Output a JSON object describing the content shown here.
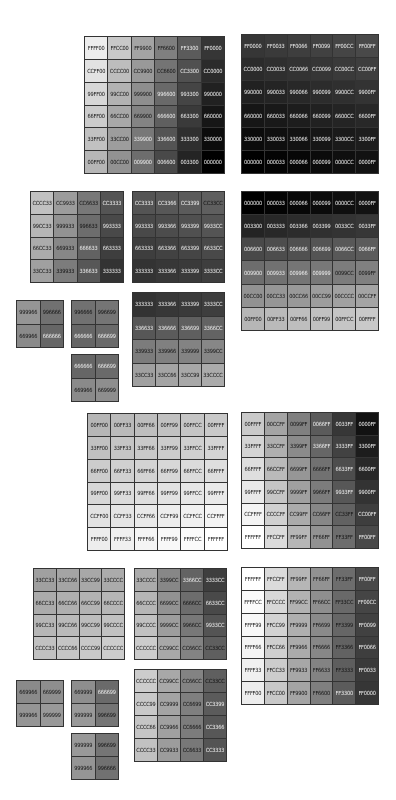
{
  "swatch_grids": [
    {
      "id": "g1",
      "x": 84,
      "y": 36,
      "w": 141,
      "h": 138,
      "cols": 6,
      "cells": [
        "FFFF00",
        "FFCC00",
        "FF9900",
        "FF6600",
        "FF3300",
        "FF0000",
        "CCFF00",
        "CCCC00",
        "CC9900",
        "CC6600",
        "CC3300",
        "CC0000",
        "99FF00",
        "99CC00",
        "999900",
        "996600",
        "993300",
        "990000",
        "66FF00",
        "66CC00",
        "669900",
        "666600",
        "663300",
        "660000",
        "33FF00",
        "33CC00",
        "339900",
        "336600",
        "333300",
        "330000",
        "00FF00",
        "00CC00",
        "009900",
        "006600",
        "003300",
        "000000"
      ]
    },
    {
      "id": "g2",
      "x": 241,
      "y": 34,
      "w": 138,
      "h": 140,
      "cols": 6,
      "cells": [
        "FF0000",
        "FF0033",
        "FF0066",
        "FF0099",
        "FF00CC",
        "FF00FF",
        "CC0000",
        "CC0033",
        "CC0066",
        "CC0099",
        "CC00CC",
        "CC00FF",
        "990000",
        "990033",
        "990066",
        "990099",
        "9900CC",
        "9900FF",
        "660000",
        "660033",
        "660066",
        "660099",
        "6600CC",
        "6600FF",
        "330000",
        "330033",
        "330066",
        "330099",
        "3300CC",
        "3300FF",
        "000000",
        "000033",
        "000066",
        "000099",
        "0000CC",
        "0000FF"
      ]
    },
    {
      "id": "g3",
      "x": 30,
      "y": 191,
      "w": 94,
      "h": 92,
      "cols": 4,
      "cells": [
        "CCCC33",
        "CC9933",
        "CC6633",
        "CC3333",
        "99CC33",
        "999933",
        "996633",
        "993333",
        "66CC33",
        "669933",
        "666633",
        "663333",
        "33CC33",
        "339933",
        "336633",
        "333333"
      ]
    },
    {
      "id": "g4",
      "x": 132,
      "y": 191,
      "w": 93,
      "h": 92,
      "cols": 4,
      "cells": [
        "CC3333",
        "CC3366",
        "CC3399",
        "CC33CC",
        "993333",
        "993366",
        "993399",
        "9933CC",
        "663333",
        "663366",
        "663399",
        "6633CC",
        "333333",
        "333366",
        "333399",
        "3333CC"
      ]
    },
    {
      "id": "g5",
      "x": 241,
      "y": 191,
      "w": 138,
      "h": 140,
      "cols": 6,
      "cells": [
        "000000",
        "000033",
        "000066",
        "000099",
        "0000CC",
        "0000FF",
        "003300",
        "003333",
        "003366",
        "003399",
        "0033CC",
        "0033FF",
        "006600",
        "006633",
        "006666",
        "006699",
        "0066CC",
        "0066FF",
        "009900",
        "009933",
        "009966",
        "009999",
        "0099CC",
        "0099FF",
        "00CC00",
        "00CC33",
        "00CC66",
        "00CC99",
        "00CCCC",
        "00CCFF",
        "00FF00",
        "00FF33",
        "00FF66",
        "00FF99",
        "00FFCC",
        "00FFFF"
      ]
    },
    {
      "id": "g6",
      "x": 16,
      "y": 300,
      "w": 48,
      "h": 48,
      "cols": 2,
      "cells": [
        "999966",
        "996666",
        "669966",
        "666666"
      ]
    },
    {
      "id": "g7",
      "x": 71,
      "y": 300,
      "w": 48,
      "h": 48,
      "cols": 2,
      "cells": [
        "996666",
        "996699",
        "666666",
        "666699"
      ]
    },
    {
      "id": "g8",
      "x": 71,
      "y": 354,
      "w": 48,
      "h": 48,
      "cols": 2,
      "cells": [
        "666666",
        "666699",
        "669966",
        "669999"
      ]
    },
    {
      "id": "g9",
      "x": 132,
      "y": 292,
      "w": 93,
      "h": 95,
      "cols": 4,
      "cells": [
        "333333",
        "333366",
        "333399",
        "3333CC",
        "336633",
        "336666",
        "336699",
        "3366CC",
        "339933",
        "339966",
        "339999",
        "3399CC",
        "33CC33",
        "33CC66",
        "33CC99",
        "33CCCC"
      ]
    },
    {
      "id": "g10",
      "x": 87,
      "y": 413,
      "w": 141,
      "h": 138,
      "cols": 6,
      "cells": [
        "00FF00",
        "00FF33",
        "00FF66",
        "00FF99",
        "00FFCC",
        "00FFFF",
        "33FF00",
        "33FF33",
        "33FF66",
        "33FF99",
        "33FFCC",
        "33FFFF",
        "66FF00",
        "66FF33",
        "66FF66",
        "66FF99",
        "66FFCC",
        "66FFFF",
        "99FF00",
        "99FF33",
        "99FF66",
        "99FF99",
        "99FFCC",
        "99FFFF",
        "CCFF00",
        "CCFF33",
        "CCFF66",
        "CCFF99",
        "CCFFCC",
        "CCFFFF",
        "FFFF00",
        "FFFF33",
        "FFFF66",
        "FFFF99",
        "FFFFCC",
        "FFFFFF"
      ]
    },
    {
      "id": "g11",
      "x": 241,
      "y": 412,
      "w": 138,
      "h": 137,
      "cols": 6,
      "cells": [
        "00FFFF",
        "00CCFF",
        "0099FF",
        "0066FF",
        "0033FF",
        "0000FF",
        "33FFFF",
        "33CCFF",
        "3399FF",
        "3366FF",
        "3333FF",
        "3300FF",
        "66FFFF",
        "66CCFF",
        "6699FF",
        "6666FF",
        "6633FF",
        "6600FF",
        "99FFFF",
        "99CCFF",
        "9999FF",
        "9966FF",
        "9933FF",
        "9900FF",
        "CCFFFF",
        "CCCCFF",
        "CC99FF",
        "CC66FF",
        "CC33FF",
        "CC00FF",
        "FFFFFF",
        "FFCCFF",
        "FF99FF",
        "FF66FF",
        "FF33FF",
        "FF00FF"
      ]
    },
    {
      "id": "g12",
      "x": 33,
      "y": 568,
      "w": 92,
      "h": 92,
      "cols": 4,
      "cells": [
        "33CC33",
        "33CC66",
        "33CC99",
        "33CCCC",
        "66CC33",
        "66CC66",
        "66CC99",
        "66CCCC",
        "99CC33",
        "99CC66",
        "99CC99",
        "99CCCC",
        "CCCC33",
        "CCCC66",
        "CCCC99",
        "CCCCCC"
      ]
    },
    {
      "id": "g13",
      "x": 134,
      "y": 568,
      "w": 93,
      "h": 92,
      "cols": 4,
      "cells": [
        "33CCCC",
        "3399CC",
        "3366CC",
        "3333CC",
        "66CCCC",
        "6699CC",
        "6666CC",
        "6633CC",
        "99CCCC",
        "9999CC",
        "9966CC",
        "9933CC",
        "CCCCCC",
        "CC99CC",
        "CC66CC",
        "CC33CC"
      ]
    },
    {
      "id": "g14",
      "x": 134,
      "y": 669,
      "w": 93,
      "h": 93,
      "cols": 4,
      "cells": [
        "CCCCCC",
        "CC99CC",
        "CC66CC",
        "CC33CC",
        "CCCC99",
        "CC9999",
        "CC6699",
        "CC3399",
        "CCCC66",
        "CC9966",
        "CC6666",
        "CC3366",
        "CCCC33",
        "CC9933",
        "CC6633",
        "CC3333"
      ]
    },
    {
      "id": "g15",
      "x": 16,
      "y": 680,
      "w": 48,
      "h": 47,
      "cols": 2,
      "cells": [
        "669966",
        "669999",
        "999966",
        "999999"
      ]
    },
    {
      "id": "g16",
      "x": 71,
      "y": 680,
      "w": 48,
      "h": 47,
      "cols": 2,
      "cells": [
        "669999",
        "666699",
        "999999",
        "996699"
      ]
    },
    {
      "id": "g17",
      "x": 71,
      "y": 733,
      "w": 48,
      "h": 47,
      "cols": 2,
      "cells": [
        "999999",
        "996699",
        "999966",
        "996666"
      ]
    },
    {
      "id": "g18",
      "x": 241,
      "y": 567,
      "w": 138,
      "h": 138,
      "cols": 6,
      "cells": [
        "FFFFFF",
        "FFCCFF",
        "FF99FF",
        "FF66FF",
        "FF33FF",
        "FF00FF",
        "FFFFCC",
        "FFCCCC",
        "FF99CC",
        "FF66CC",
        "FF33CC",
        "FF00CC",
        "FFFF99",
        "FFCC99",
        "FF9999",
        "FF6699",
        "FF3399",
        "FF0099",
        "FFFF66",
        "FFCC66",
        "FF9966",
        "FF6666",
        "FF3366",
        "FF0066",
        "FFFF33",
        "FFCC33",
        "FF9933",
        "FF6633",
        "FF3333",
        "FF0033",
        "FFFF00",
        "FFCC00",
        "FF9900",
        "FF6600",
        "FF3300",
        "FF0000"
      ]
    }
  ]
}
